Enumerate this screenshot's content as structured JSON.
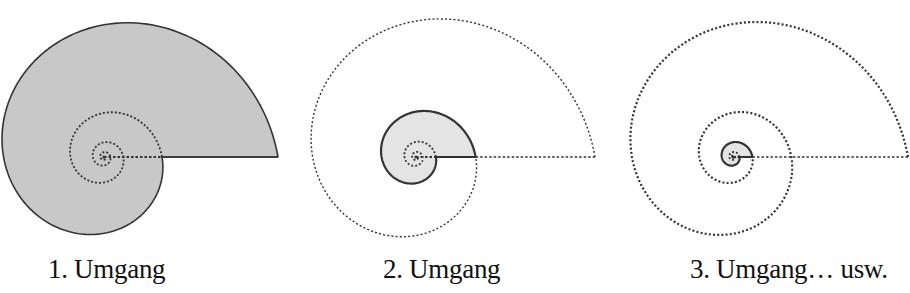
{
  "colors": {
    "fill_dark": "#c8c8c8",
    "fill_light": "#e4e4e4",
    "stroke": "#333333"
  },
  "spiral": {
    "growth_per_turn": 3
  },
  "panels": [
    {
      "id": "shell-1",
      "caption": "1. Umgang",
      "caption_x": 48,
      "center": [
        104,
        157
      ],
      "outer_radius": 174,
      "shaded_turns": 1,
      "shade": "dark",
      "dotted_outer_turns": 0,
      "inner_dotted_turns": 3
    },
    {
      "id": "shell-2",
      "caption": "2. Umgang",
      "caption_x": 383,
      "center": [
        416,
        157
      ],
      "outer_radius": 179,
      "shaded_turns": 1,
      "shade": "light",
      "dotted_outer_turns": 1,
      "inner_dotted_turns": 2
    },
    {
      "id": "shell-3",
      "caption": "3. Umgang… usw.",
      "caption_x": 690,
      "center": [
        733,
        157
      ],
      "outer_radius": 175,
      "shaded_turns": 1,
      "shade": "light",
      "dotted_outer_turns": 2,
      "inner_dotted_turns": 2
    }
  ]
}
